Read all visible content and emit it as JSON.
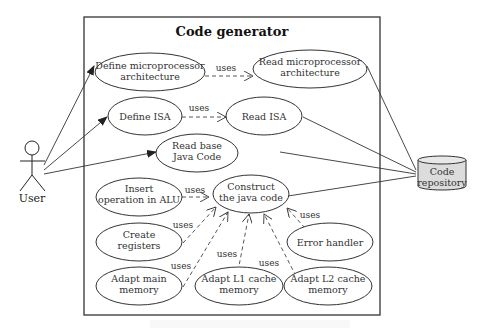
{
  "diagram": {
    "type": "uml-use-case",
    "system_title": "Code generator",
    "actor": {
      "label": "User"
    },
    "datastore": {
      "label_line1": "Code",
      "label_line2": "repository",
      "fill": "#dcdcdc"
    },
    "use_cases": [
      {
        "id": "define_arch",
        "line1": "Define microprocessor",
        "line2": "architecture"
      },
      {
        "id": "read_arch",
        "line1": "Read microprocessor",
        "line2": "architecture"
      },
      {
        "id": "define_isa",
        "line1": "Define ISA",
        "line2": ""
      },
      {
        "id": "read_isa",
        "line1": "Read ISA",
        "line2": ""
      },
      {
        "id": "read_base",
        "line1": "Read base",
        "line2": "Java Code"
      },
      {
        "id": "insert_alu",
        "line1": "Insert",
        "line2": "operation in ALU"
      },
      {
        "id": "construct",
        "line1": "Construct",
        "line2": "the java code"
      },
      {
        "id": "create_regs",
        "line1": "Create",
        "line2": "registers"
      },
      {
        "id": "error_handler",
        "line1": "Error handler",
        "line2": ""
      },
      {
        "id": "adapt_main",
        "line1": "Adapt main",
        "line2": "memory"
      },
      {
        "id": "adapt_l1",
        "line1": "Adapt L1 cache",
        "line2": "memory"
      },
      {
        "id": "adapt_l2",
        "line1": "Adapt L2 cache",
        "line2": "memory"
      }
    ],
    "relation_label": "uses",
    "relations": [
      {
        "from": "define_arch",
        "to": "read_arch",
        "label": "uses"
      },
      {
        "from": "define_isa",
        "to": "read_isa",
        "label": "uses"
      },
      {
        "from": "insert_alu",
        "to": "construct",
        "label": "uses"
      },
      {
        "from": "create_regs",
        "to": "construct",
        "label": "uses"
      },
      {
        "from": "adapt_main",
        "to": "construct",
        "label": "uses"
      },
      {
        "from": "adapt_l1",
        "to": "construct",
        "label": "uses"
      },
      {
        "from": "adapt_l2",
        "to": "construct",
        "label": "uses"
      },
      {
        "from": "error_handler",
        "to": "construct",
        "label": "uses"
      }
    ],
    "associations": [
      {
        "from": "User",
        "to": "define_arch"
      },
      {
        "from": "User",
        "to": "define_isa"
      },
      {
        "from": "User",
        "to": "read_base"
      },
      {
        "from": "read_arch",
        "to": "Code repository"
      },
      {
        "from": "read_isa",
        "to": "Code repository"
      },
      {
        "from": "read_base",
        "to": "Code repository"
      },
      {
        "from": "construct",
        "to": "Code repository"
      }
    ]
  }
}
